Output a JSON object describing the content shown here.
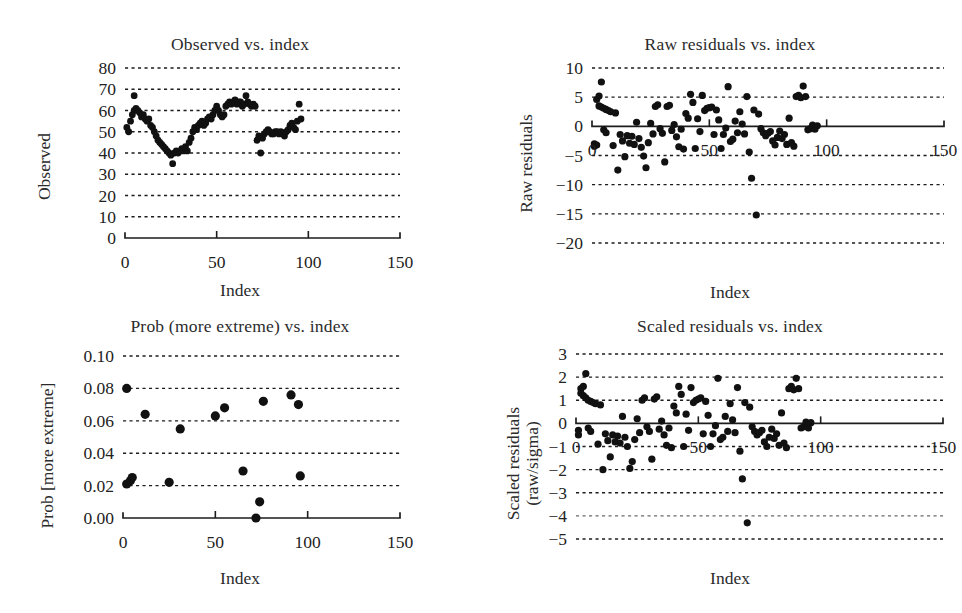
{
  "figure": {
    "background": "#ffffff",
    "ink": "#111111",
    "panel_count": 4
  },
  "panels": [
    {
      "id": "observed-vs-index",
      "title": "Observed vs. index",
      "ylabel": "Observed",
      "xlabel": "Index",
      "yticks": [
        "0",
        "10",
        "20",
        "30",
        "40",
        "50",
        "60",
        "70",
        "80"
      ],
      "xticks": [
        "0",
        "50",
        "100",
        "150"
      ]
    },
    {
      "id": "raw-residuals-vs-index",
      "title": "Raw residuals vs. index",
      "ylabel": "Raw residuals",
      "xlabel": "Index",
      "yticks": [
        "−20",
        "−15",
        "−10",
        "−5",
        "0",
        "5",
        "10"
      ],
      "xticks": [
        "0",
        "50",
        "100",
        "150"
      ]
    },
    {
      "id": "prob-more-extreme-vs-index",
      "title": "Prob (more extreme) vs. index",
      "ylabel": "Prob [more extreme]",
      "xlabel": "Index",
      "yticks": [
        "0.00",
        "0.02",
        "0.04",
        "0.06",
        "0.08",
        "0.10"
      ],
      "xticks": [
        "0",
        "50",
        "100",
        "150"
      ]
    },
    {
      "id": "scaled-residuals-vs-index",
      "title": "Scaled residuals vs. index",
      "ylabel_line1": "Scaled residuals",
      "ylabel_line2": "(raw/sigma)",
      "xlabel": "Index",
      "yticks": [
        "−5",
        "−4",
        "−3",
        "−2",
        "−1",
        "0",
        "1",
        "2",
        "3"
      ],
      "xticks": [
        "0",
        "50",
        "100",
        "150"
      ]
    }
  ],
  "chart_data": [
    {
      "type": "scatter",
      "title": "Observed vs. index",
      "xlabel": "Index",
      "ylabel": "Observed",
      "xlim": [
        0,
        150
      ],
      "ylim": [
        0,
        80
      ],
      "xticks": [
        0,
        50,
        100,
        150
      ],
      "yticks": [
        0,
        10,
        20,
        30,
        40,
        50,
        60,
        70,
        80
      ],
      "grid": "horizontal-dotted",
      "axis_line_at_y": 0,
      "legend": "none",
      "x": [
        1,
        2,
        3,
        4,
        5,
        5,
        6,
        7,
        8,
        9,
        10,
        11,
        12,
        13,
        14,
        15,
        16,
        17,
        18,
        19,
        20,
        21,
        22,
        23,
        24,
        25,
        26,
        27,
        28,
        29,
        30,
        31,
        32,
        33,
        34,
        35,
        36,
        37,
        38,
        39,
        40,
        41,
        42,
        43,
        44,
        45,
        46,
        47,
        48,
        49,
        50,
        51,
        52,
        53,
        54,
        55,
        56,
        57,
        58,
        59,
        60,
        61,
        62,
        63,
        64,
        65,
        66,
        67,
        68,
        69,
        70,
        71,
        72,
        73,
        74,
        75,
        76,
        77,
        78,
        79,
        80,
        81,
        82,
        83,
        84,
        85,
        86,
        87,
        88,
        89,
        90,
        91,
        92,
        93,
        94,
        95,
        96
      ],
      "y": [
        52,
        50,
        55,
        58,
        67,
        60,
        61,
        60,
        59,
        57,
        58,
        56,
        55,
        56,
        53,
        52,
        50,
        48,
        46,
        45,
        44,
        43,
        42,
        41,
        40,
        39,
        35,
        40,
        41,
        40,
        41,
        42,
        41,
        43,
        41,
        45,
        47,
        50,
        52,
        51,
        53,
        54,
        55,
        53,
        54,
        56,
        57,
        56,
        58,
        60,
        62,
        60,
        58,
        57,
        58,
        62,
        63,
        64,
        63,
        64,
        65,
        63,
        64,
        64,
        62,
        63,
        67,
        64,
        63,
        62,
        63,
        62,
        46,
        48,
        40,
        47,
        49,
        50,
        51,
        50,
        49,
        49,
        50,
        50,
        49,
        50,
        49,
        48,
        50,
        51,
        53,
        54,
        52,
        51,
        55,
        63,
        56
      ]
    },
    {
      "type": "scatter",
      "title": "Raw residuals vs. index",
      "xlabel": "Index",
      "ylabel": "Raw residuals",
      "xlim": [
        0,
        150
      ],
      "ylim": [
        -20,
        10
      ],
      "xticks": [
        0,
        50,
        100,
        150
      ],
      "yticks": [
        -20,
        -15,
        -10,
        -5,
        0,
        5,
        10
      ],
      "grid": "horizontal-dotted",
      "axis_line_at_y": 0,
      "legend": "none",
      "x": [
        1,
        1,
        2,
        2,
        3,
        3,
        4,
        4,
        5,
        5,
        6,
        6,
        7,
        8,
        9,
        10,
        11,
        12,
        13,
        14,
        15,
        16,
        17,
        18,
        19,
        20,
        21,
        22,
        23,
        24,
        25,
        26,
        27,
        28,
        29,
        30,
        31,
        32,
        33,
        34,
        35,
        36,
        37,
        38,
        39,
        40,
        41,
        42,
        43,
        44,
        45,
        46,
        47,
        48,
        49,
        50,
        51,
        52,
        53,
        54,
        55,
        56,
        57,
        58,
        59,
        60,
        61,
        62,
        63,
        64,
        65,
        66,
        67,
        68,
        69,
        70,
        71,
        72,
        73,
        74,
        75,
        76,
        77,
        78,
        79,
        80,
        81,
        82,
        83,
        84,
        85,
        86,
        87,
        88,
        89,
        90,
        91,
        92,
        93,
        94,
        95,
        96
      ],
      "y": [
        -3,
        -3.4,
        -3.2,
        4.6,
        5.2,
        3.5,
        7.6,
        3.3,
        3.1,
        -0.6,
        2.9,
        -1.1,
        2.7,
        2.5,
        -3.3,
        2.3,
        -7.5,
        -1.4,
        -2.5,
        -5.2,
        -1.6,
        -2.9,
        -1.7,
        -3.1,
        0.7,
        -2.1,
        -3.6,
        -5.1,
        -7.1,
        -2.8,
        0.5,
        -1.3,
        3.4,
        3.7,
        -0.4,
        -1.2,
        -6.1,
        3.4,
        3.6,
        -0.7,
        0.3,
        -1.8,
        -3.5,
        -0.5,
        -3.9,
        2.2,
        1.4,
        5.5,
        4.1,
        -3.8,
        1.3,
        -0.9,
        5.3,
        2.7,
        3.1,
        3.2,
        3.3,
        -1.4,
        2.8,
        1.1,
        -3.8,
        -1.4,
        -0.3,
        6.8,
        -2.6,
        -2.2,
        0.9,
        -1.1,
        2.5,
        0.4,
        -1.3,
        5.1,
        -4.4,
        -8.9,
        2.8,
        -15.2,
        2.1,
        -0.4,
        -1.1,
        -1.6,
        -1.2,
        -0.9,
        -2.5,
        -3.2,
        -1.9,
        -0.8,
        -2.1,
        -1.4,
        -3.1,
        1.4,
        -2.8,
        -3.4,
        5.1,
        5.3,
        4.9,
        6.9,
        5.1,
        -0.6,
        -0.4,
        0.2,
        -0.5,
        0.1,
        -0.3
      ]
    },
    {
      "type": "scatter",
      "title": "Prob (more extreme) vs. index",
      "xlabel": "Index",
      "ylabel": "Prob [more extreme]",
      "xlim": [
        0,
        150
      ],
      "ylim": [
        0.0,
        0.1
      ],
      "xticks": [
        0,
        50,
        100,
        150
      ],
      "yticks": [
        0.0,
        0.02,
        0.04,
        0.06,
        0.08,
        0.1
      ],
      "grid": "horizontal-dotted",
      "axis_line_at_y": 0.0,
      "legend": "none",
      "x": [
        2,
        2,
        4,
        5,
        12,
        25,
        31,
        50,
        55,
        65,
        72,
        74,
        76,
        91,
        95,
        96
      ],
      "y": [
        0.08,
        0.021,
        0.023,
        0.025,
        0.064,
        0.022,
        0.055,
        0.063,
        0.068,
        0.029,
        0.0,
        0.01,
        0.072,
        0.076,
        0.07,
        0.026
      ]
    },
    {
      "type": "scatter",
      "title": "Scaled residuals vs. index",
      "xlabel": "Index",
      "ylabel": "Scaled residuals (raw/sigma)",
      "xlim": [
        0,
        150
      ],
      "ylim": [
        -5,
        3
      ],
      "xticks": [
        0,
        50,
        100,
        150
      ],
      "yticks": [
        -5,
        -4,
        -3,
        -2,
        -1,
        0,
        1,
        2,
        3
      ],
      "grid": "horizontal-dotted",
      "axis_line_at_y": 0,
      "legend": "none",
      "x": [
        1,
        1,
        2,
        2,
        3,
        3,
        4,
        4,
        5,
        5,
        6,
        6,
        7,
        8,
        9,
        10,
        11,
        12,
        13,
        14,
        15,
        16,
        17,
        18,
        19,
        20,
        21,
        22,
        23,
        24,
        25,
        26,
        27,
        28,
        29,
        30,
        31,
        32,
        33,
        34,
        35,
        36,
        37,
        38,
        39,
        40,
        41,
        42,
        43,
        44,
        45,
        46,
        47,
        48,
        49,
        50,
        51,
        52,
        53,
        54,
        55,
        56,
        57,
        58,
        59,
        60,
        61,
        62,
        63,
        64,
        65,
        66,
        67,
        68,
        69,
        70,
        71,
        72,
        73,
        74,
        75,
        76,
        77,
        78,
        79,
        80,
        81,
        82,
        83,
        84,
        85,
        86,
        87,
        88,
        89,
        90,
        91,
        92,
        93,
        94,
        95,
        96
      ],
      "y": [
        -0.3,
        -0.5,
        1.3,
        1.5,
        1.6,
        1.2,
        2.15,
        1.1,
        1.0,
        -0.2,
        0.95,
        -0.35,
        0.9,
        0.85,
        -0.9,
        0.8,
        -2.0,
        -0.45,
        -0.75,
        -1.45,
        -0.5,
        -0.8,
        -0.55,
        -0.85,
        0.3,
        -0.6,
        -1.0,
        -1.95,
        -1.65,
        -0.7,
        0.2,
        -0.4,
        1.0,
        1.1,
        -0.15,
        -0.35,
        -1.55,
        1.05,
        1.15,
        -0.25,
        0.1,
        -0.5,
        -0.95,
        -0.2,
        -1.05,
        0.75,
        0.45,
        1.6,
        1.25,
        -1.0,
        0.4,
        -0.3,
        1.55,
        0.9,
        1.0,
        1.05,
        1.1,
        -0.45,
        0.95,
        0.35,
        -1.0,
        -0.45,
        -0.1,
        1.95,
        -0.7,
        -0.6,
        0.3,
        -0.35,
        0.85,
        0.15,
        -0.4,
        1.55,
        -1.2,
        -2.4,
        0.9,
        -4.3,
        0.7,
        -0.15,
        -0.35,
        -0.5,
        -0.4,
        -0.3,
        -0.8,
        -1.0,
        -0.6,
        -0.25,
        -0.65,
        -0.45,
        -0.95,
        0.45,
        -0.85,
        -1.05,
        1.5,
        1.6,
        1.45,
        1.95,
        1.5,
        -0.2,
        -0.15,
        0.05,
        -0.2,
        0.03,
        -0.1
      ]
    }
  ]
}
